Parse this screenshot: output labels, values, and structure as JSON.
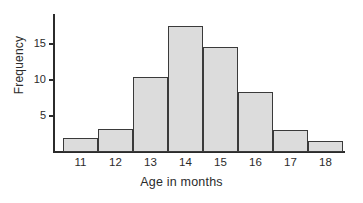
{
  "figure": {
    "background_color": "#ffffff",
    "axis_color": "#2b2b2b",
    "bar_fill_color": "#dcdcdc",
    "bar_border_color": "#3a3a3a"
  },
  "chart_data": {
    "type": "bar",
    "title": "",
    "subtitle": "",
    "xlabel": "Age in months",
    "ylabel": "Frequency",
    "categories": [
      "11",
      "12",
      "13",
      "14",
      "15",
      "16",
      "17",
      "18"
    ],
    "values": [
      2,
      3.2,
      10.4,
      17.5,
      14.6,
      8.3,
      3,
      1.5
    ],
    "y_ticks": [
      5,
      10,
      15
    ],
    "y_tick_labels": [
      "5",
      "10",
      "15"
    ],
    "ylim": [
      0,
      19.3
    ],
    "x_tick_labels": [
      "11",
      "12",
      "13",
      "14",
      "15",
      "16",
      "17",
      "18"
    ],
    "grid": false,
    "legend": null,
    "annotations": []
  }
}
